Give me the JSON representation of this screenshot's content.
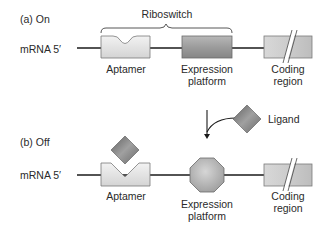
{
  "panels": {
    "on": {
      "title": "(a) On",
      "mrna_label": "mRNA  5′",
      "riboswitch_label": "Riboswitch",
      "aptamer_label": "Aptamer",
      "expression_label_line1": "Expression",
      "expression_label_line2": "platform",
      "coding_label_line1": "Coding",
      "coding_label_line2": "region"
    },
    "off": {
      "title": "(b) Off",
      "mrna_label": "mRNA  5′",
      "aptamer_label": "Aptamer",
      "expression_label_line1": "Expression",
      "expression_label_line2": "platform",
      "coding_label_line1": "Coding",
      "coding_label_line2": "region"
    }
  },
  "ligand": {
    "label": "Ligand"
  },
  "colors": {
    "strand": "#1a1a1a",
    "aptamer_fill": "#e2e2e2",
    "expression_fill": "#9a9a9a",
    "coding_fill": "#cfcfcf",
    "ligand_fill": "#7d7d7d",
    "octagon_fill": "#b8b8b8",
    "outline": "#6a6a6a"
  }
}
